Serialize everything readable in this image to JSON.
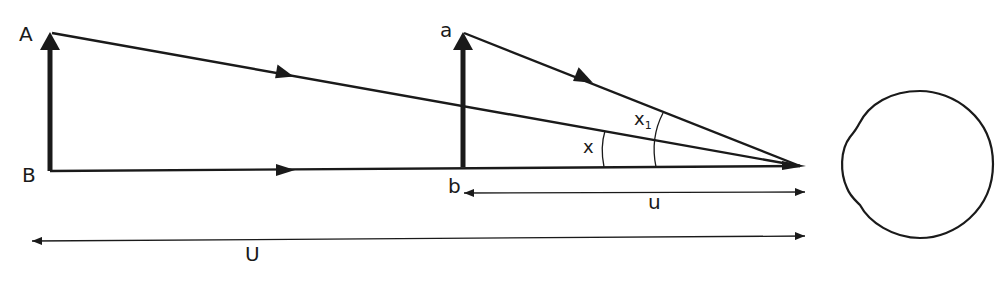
{
  "diagram": {
    "colors": {
      "stroke": "#1a1a1a",
      "background": "#ffffff"
    },
    "labels": {
      "A": "A",
      "B": "B",
      "a": "a",
      "b": "b",
      "x": "x",
      "x1_main": "x",
      "x1_sub": "1",
      "u": "u",
      "U": "U"
    },
    "elements": [
      "object-arrow-AB",
      "object-arrow-ab",
      "ray-A-to-eye",
      "ray-a-to-eye",
      "axis-B-to-eye",
      "angle-arc-x",
      "angle-arc-x1",
      "dimension-u",
      "dimension-U",
      "eye"
    ]
  }
}
